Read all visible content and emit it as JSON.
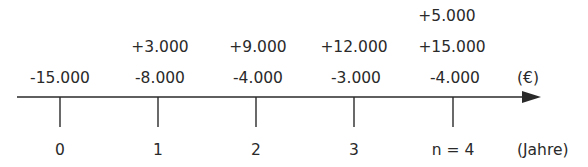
{
  "diagram": {
    "type": "cash-flow timeline",
    "currency_unit": "(€)",
    "time_unit": "(Jahre)",
    "periods": [
      {
        "label": "0",
        "x": 60,
        "cash_flows": [
          "-15.000"
        ]
      },
      {
        "label": "1",
        "x": 158,
        "cash_flows": [
          "+3.000",
          "-8.000"
        ]
      },
      {
        "label": "2",
        "x": 256,
        "cash_flows": [
          "+9.000",
          "-4.000"
        ]
      },
      {
        "label": "3",
        "x": 354,
        "cash_flows": [
          "+12.000",
          "-3.000"
        ]
      },
      {
        "label": "n = 4",
        "x": 453,
        "cash_flows": [
          "+5.000",
          "+15.000",
          "-4.000"
        ]
      }
    ],
    "colors": {
      "line": "#2a2a2a",
      "text": "#2a2a2a"
    }
  },
  "rows": {
    "row1": {
      "p4": "+5.000"
    },
    "row2": {
      "p1": "+3.000",
      "p2": "+9.000",
      "p3": "+12.000",
      "p4": "+15.000"
    },
    "row3": {
      "p0": "-15.000",
      "p1": "-8.000",
      "p2": "-4.000",
      "p3": "-3.000",
      "p4": "-4.000"
    }
  },
  "axis": {
    "ticks": [
      "0",
      "1",
      "2",
      "3",
      "n = 4"
    ],
    "currency_unit": "(€)",
    "time_unit": "(Jahre)"
  }
}
